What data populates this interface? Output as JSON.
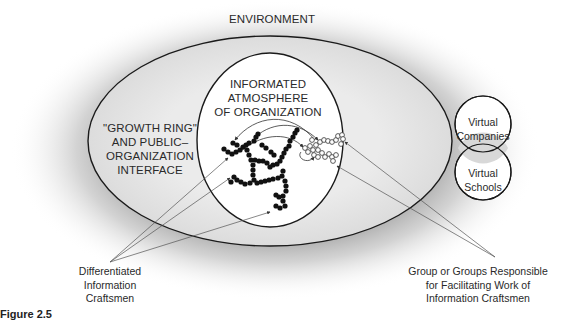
{
  "figure": {
    "caption": "Figure 2.5"
  },
  "labels": {
    "environment": "ENVIRONMENT",
    "informated_atmosphere": "INFORMATED\nATMOSPHERE\nOF ORGANIZATION",
    "growth_ring": "\"GROWTH RING\"\nAND PUBLIC–\nORGANIZATION\nINTERFACE",
    "virtual_companies": "Virtual\nCompanies",
    "virtual_schools": "Virtual\nSchools",
    "differentiated_craftsmen": "Differentiated\nInformation\nCraftsmen",
    "facilitating_groups": "Group or Groups Responsible\nfor Facilitating Work of\nInformation Craftsmen"
  },
  "colors": {
    "halo": "#b8b8b8",
    "organization_fill": "#e4e4e4",
    "inner_fill": "#ffffff",
    "stroke": "#1a1a1a",
    "pointer": "#555555"
  }
}
